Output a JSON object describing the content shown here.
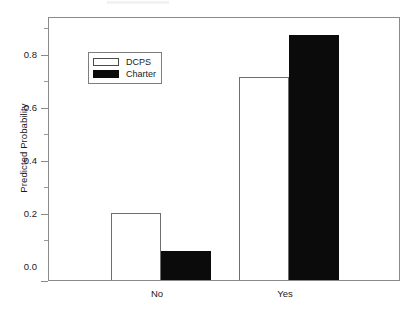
{
  "chart_data": {
    "type": "bar",
    "title": "",
    "subtitle": "",
    "xlabel": "",
    "ylabel": "Predicted Probability",
    "categories": [
      "No",
      "Yes"
    ],
    "series": [
      {
        "name": "DCPS",
        "color": "#ffffff",
        "values": [
          0.253,
          0.765
        ]
      },
      {
        "name": "Charter",
        "color": "#000000",
        "values": [
          0.108,
          0.92
        ]
      }
    ],
    "ylim": [
      0.0,
      0.985
    ],
    "yticks": [
      0.0,
      0.2,
      0.4,
      0.6,
      0.8
    ],
    "ytick_labels": [
      "0.0",
      "0.2",
      "0.4",
      "0.6",
      "0.8"
    ],
    "yminor_ticks": [
      0.1,
      0.3,
      0.5,
      0.7,
      0.9
    ],
    "grid": false,
    "legend_position": "upper left",
    "frame": true
  },
  "axis": {
    "ylabel": "Predicted Probability",
    "ytick_labels": [
      "0.8",
      "0.6",
      "0.4",
      "0.2",
      "0.0"
    ],
    "xtick_labels": [
      "No",
      "Yes"
    ]
  },
  "legend": {
    "items": [
      {
        "label": "DCPS",
        "swatch": "open-square-swatch"
      },
      {
        "label": "Charter",
        "swatch": "filled-square-swatch"
      }
    ]
  }
}
